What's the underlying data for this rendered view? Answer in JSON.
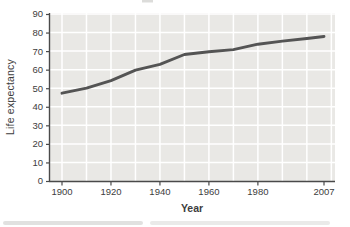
{
  "figure": {
    "ylabel": "Life expectancy",
    "xlabel": "Year",
    "ytick_labels": [
      "0",
      "10",
      "20",
      "30",
      "40",
      "50",
      "60",
      "70",
      "80",
      "90"
    ],
    "xtick_labels": [
      "1900",
      "1920",
      "1940",
      "1960",
      "1980",
      "2007"
    ]
  },
  "chart_data": {
    "type": "line",
    "title": "",
    "xlabel": "Year",
    "ylabel": "Life expectancy",
    "x": [
      1900,
      1910,
      1920,
      1930,
      1940,
      1950,
      1960,
      1970,
      1980,
      1990,
      2000,
      2007
    ],
    "values": [
      47.3,
      50.0,
      54.1,
      59.7,
      62.9,
      68.2,
      69.7,
      70.8,
      73.7,
      75.4,
      76.8,
      77.9
    ],
    "series_name": "Life expectancy",
    "xlim": [
      1895,
      2012
    ],
    "ylim": [
      0,
      90
    ],
    "ytick_values": [
      0,
      10,
      20,
      30,
      40,
      50,
      60,
      70,
      80,
      90
    ],
    "xtick_values": [
      1900,
      1920,
      1940,
      1960,
      1980,
      2007
    ],
    "x_gridline_years": [
      1900,
      1910,
      1920,
      1930,
      1940,
      1950,
      1960,
      1970,
      1980,
      1990,
      2000,
      2010
    ],
    "grid": true,
    "legend": "none"
  },
  "colors": {
    "page_bg": "#ffffff",
    "plot_bg": "#e9e8e5",
    "grid": "#ffffff",
    "line": "#545454",
    "axis": "#4a4a4a",
    "text": "#3d3d3d",
    "artifact": "#c9c9c6"
  }
}
